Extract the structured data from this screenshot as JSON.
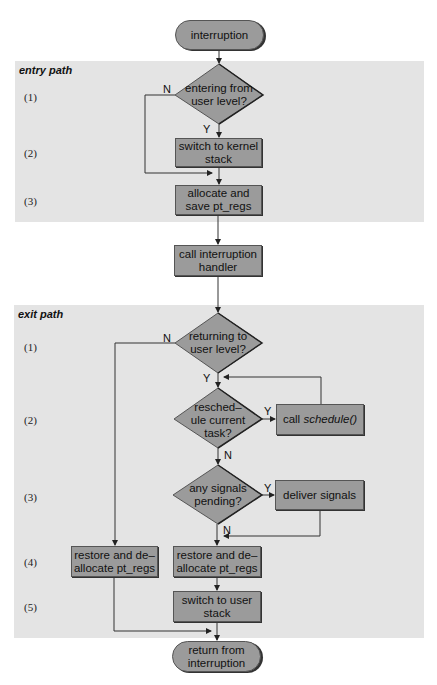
{
  "start": {
    "label": "interruption"
  },
  "entry_path": {
    "title": "entry path",
    "steps": [
      "(1)",
      "(2)",
      "(3)"
    ],
    "decision": {
      "label": "entering from user level?",
      "yes": "Y",
      "no": "N"
    },
    "switch_kernel": {
      "label": "switch to kernel stack"
    },
    "save_regs": {
      "label": "allocate and save pt_regs"
    }
  },
  "handler": {
    "label": "call interruption handler"
  },
  "exit_path": {
    "title": "exit path",
    "steps": [
      "(1)",
      "(2)",
      "(3)",
      "(4)",
      "(5)"
    ],
    "returning": {
      "label": "returning to user level?",
      "yes": "Y",
      "no": "N"
    },
    "reschedule": {
      "label": "resched– ule current task?",
      "yes": "Y",
      "no": "N"
    },
    "call_schedule": {
      "prefix": "call",
      "func": "schedule()"
    },
    "signals": {
      "label": "any signals pending?",
      "yes": "Y",
      "no": "N"
    },
    "deliver": {
      "label": "deliver signals"
    },
    "restore_left": {
      "label": "restore and de– allocate pt_regs"
    },
    "restore_right": {
      "label": "restore and de– allocate pt_regs"
    },
    "switch_user": {
      "label": "switch to user stack"
    }
  },
  "end": {
    "label": "return from interruption"
  },
  "colors": {
    "panel": "#e4e4e4",
    "node": "#9b9b9b",
    "line": "#333333"
  }
}
